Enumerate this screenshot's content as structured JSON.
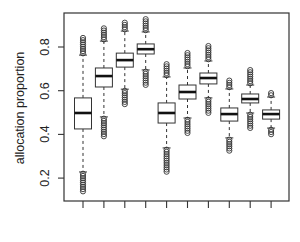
{
  "chart_data": {
    "type": "box",
    "title": "",
    "xlabel": "",
    "ylabel": "allocation proportion",
    "ylim": [
      0.095,
      0.956
    ],
    "yticks": [
      0.2,
      0.4,
      0.6,
      0.8
    ],
    "ytick_labels": [
      "0.2",
      "0.4",
      "0.6",
      "0.8"
    ],
    "xtick_labels": [
      "",
      "",
      "",
      "",
      "",
      "",
      "",
      "",
      "",
      ""
    ],
    "grid": false,
    "legend": null,
    "series": [
      {
        "name": "1",
        "outlier_min": 0.13,
        "whisker_low": 0.228,
        "q1": 0.425,
        "median": 0.498,
        "q3": 0.567,
        "whisker_high": 0.763,
        "outlier_max": 0.846
      },
      {
        "name": "2",
        "outlier_min": 0.388,
        "whisker_low": 0.48,
        "q1": 0.617,
        "median": 0.667,
        "q3": 0.704,
        "whisker_high": 0.827,
        "outlier_max": 0.89
      },
      {
        "name": "3",
        "outlier_min": 0.534,
        "whisker_low": 0.607,
        "q1": 0.708,
        "median": 0.74,
        "q3": 0.772,
        "whisker_high": 0.873,
        "outlier_max": 0.92
      },
      {
        "name": "4",
        "outlier_min": 0.626,
        "whisker_low": 0.695,
        "q1": 0.768,
        "median": 0.79,
        "q3": 0.814,
        "whisker_high": 0.869,
        "outlier_max": 0.933
      },
      {
        "name": "5",
        "outlier_min": 0.228,
        "whisker_low": 0.338,
        "q1": 0.452,
        "median": 0.498,
        "q3": 0.544,
        "whisker_high": 0.663,
        "outlier_max": 0.731
      },
      {
        "name": "6",
        "outlier_min": 0.406,
        "whisker_low": 0.475,
        "q1": 0.562,
        "median": 0.594,
        "q3": 0.626,
        "whisker_high": 0.704,
        "outlier_max": 0.782
      },
      {
        "name": "7",
        "outlier_min": 0.489,
        "whisker_low": 0.567,
        "q1": 0.631,
        "median": 0.658,
        "q3": 0.681,
        "whisker_high": 0.736,
        "outlier_max": 0.809
      },
      {
        "name": "8",
        "outlier_min": 0.324,
        "whisker_low": 0.384,
        "q1": 0.461,
        "median": 0.493,
        "q3": 0.521,
        "whisker_high": 0.608,
        "outlier_max": 0.649
      },
      {
        "name": "9",
        "outlier_min": 0.42,
        "whisker_low": 0.498,
        "q1": 0.544,
        "median": 0.562,
        "q3": 0.585,
        "whisker_high": 0.626,
        "outlier_max": 0.704
      },
      {
        "name": "10",
        "outlier_min": 0.397,
        "whisker_low": 0.429,
        "q1": 0.47,
        "median": 0.493,
        "q3": 0.512,
        "whisker_high": 0.571,
        "outlier_max": 0.599
      }
    ]
  },
  "axes": {
    "ylabel": "allocation proportion"
  },
  "colors": {
    "axis": "#333333",
    "box_fill": "#ffffff",
    "box_stroke": "#333333",
    "median": "#111111",
    "outlier": "#333333"
  }
}
